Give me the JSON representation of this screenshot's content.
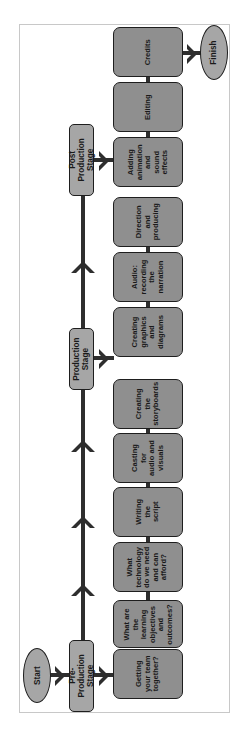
{
  "diagram": {
    "orientation": "rotated -90deg (flow runs bottom to top)",
    "colors": {
      "box_fill": "#8f8f8f",
      "stage_fill": "#a6a6a6",
      "terminal_fill": "#a6a6a6",
      "line": "#2e2e2e",
      "border": "#1e1e1e"
    },
    "start": {
      "label": "Start"
    },
    "finish": {
      "label": "Finish"
    },
    "stages": [
      {
        "label": "Pre-Production\nStage",
        "steps": [
          "Getting\nyour team\ntogether?",
          "What are\nthe\nlearning\nobjectives\nand\noutcomes?",
          "What\ntechnology\ndo we need\nand can\nafford?",
          "Writing\nthe\nscript",
          "Casting\nfor\naudio and\nvisuals",
          "Creating\nthe\nstoryboards"
        ]
      },
      {
        "label": "Production\nStage",
        "steps": [
          "Creating\ngraphics\nand\ndiagrams",
          "Audio:\nrecording\nthe\nnarration",
          "Direction\nand\nproducing"
        ]
      },
      {
        "label": "Post Production\nStage",
        "steps": [
          "Adding\nanimation\nand\nsound\neffects",
          "Editing",
          "Credits"
        ]
      }
    ]
  }
}
